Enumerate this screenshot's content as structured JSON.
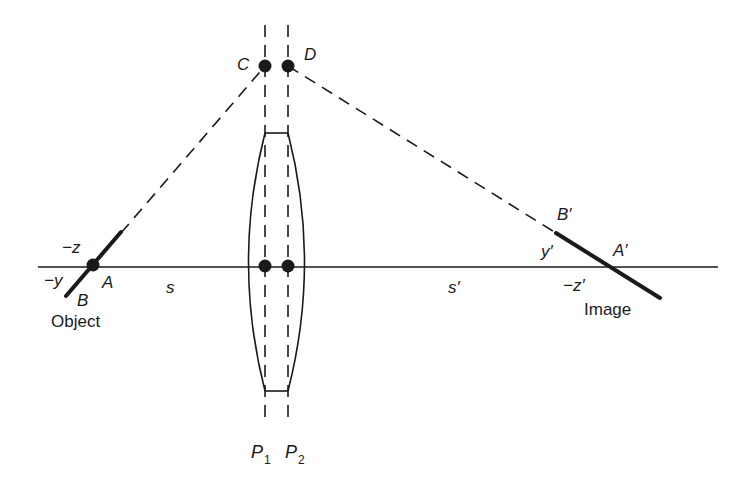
{
  "diagram": {
    "labels": {
      "point_c": "C",
      "point_d": "D",
      "neg_z": "−z",
      "neg_y": "−y",
      "point_a": "A",
      "point_b": "B",
      "object": "Object",
      "s": "s",
      "s_prime": "s′",
      "b_prime": "B′",
      "y_prime": "y′",
      "a_prime": "A′",
      "neg_z_prime": "−z′",
      "image": "Image",
      "p1": "P",
      "p1_sub": "1",
      "p2": "P",
      "p2_sub": "2"
    },
    "colors": {
      "ink": "#1a1a1a",
      "background": "#ffffff"
    }
  }
}
